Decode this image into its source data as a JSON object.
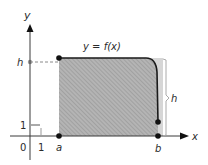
{
  "figure": {
    "function_label": "y = f(x)",
    "axes": {
      "x_label": "x",
      "y_label": "y",
      "origin_label": "0",
      "x_unit_label": "1",
      "y_unit_label": "1"
    },
    "points": {
      "a_label": "a",
      "b_label": "b"
    },
    "height": {
      "left_label": "h",
      "bracket_label": "h"
    },
    "colors": {
      "axis": "#3a3a3a",
      "curve": "#1a1a1a",
      "shade": "#a8a8a8",
      "shade_light": "#d8d8d8",
      "dashed": "#8a8a8a",
      "point": "#111111"
    }
  }
}
